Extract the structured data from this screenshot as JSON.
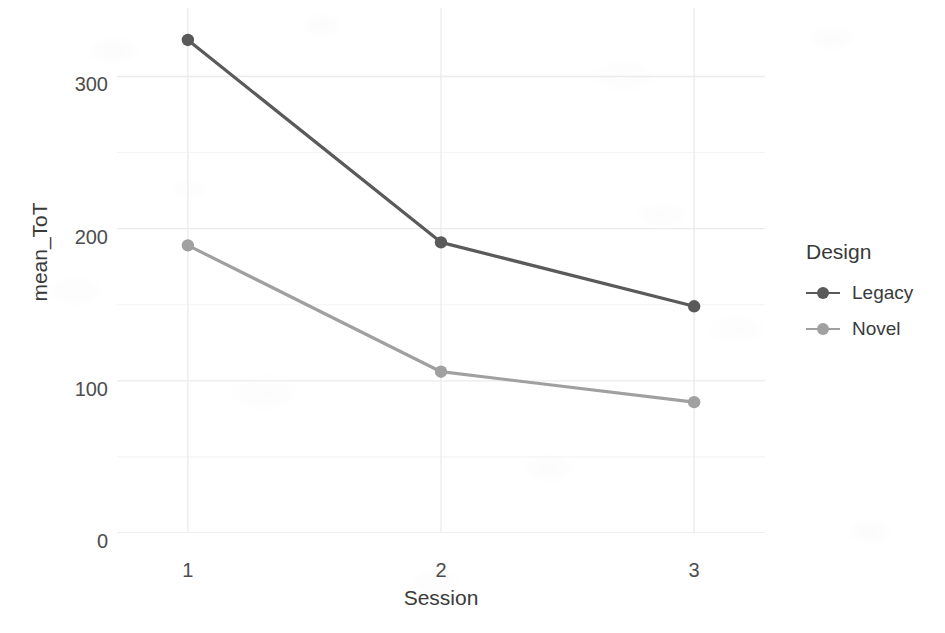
{
  "chart_data": {
    "type": "line",
    "title": "",
    "xlabel": "Session",
    "ylabel": "mean_ToT",
    "x": [
      1,
      2,
      3
    ],
    "categories": [
      "1",
      "2",
      "3"
    ],
    "series": [
      {
        "name": "Legacy",
        "values": [
          324,
          191,
          149
        ],
        "color": "#5a5a5a"
      },
      {
        "name": "Novel",
        "values": [
          189,
          106,
          86
        ],
        "color": "#a0a0a0"
      }
    ],
    "xlim": [
      0.72,
      3.28
    ],
    "ylim": [
      0,
      345
    ],
    "y_ticks": [
      0,
      100,
      200,
      300
    ],
    "y_tick_labels": [
      "0",
      "100",
      "200",
      "300"
    ],
    "y_minor_ticks": [
      50,
      150,
      250
    ],
    "x_ticks": [
      1,
      2,
      3
    ],
    "x_tick_labels": [
      "1",
      "2",
      "3"
    ],
    "grid": true,
    "grid_color": "#ebebeb",
    "minor_grid_color": "#f4f4f4",
    "legend_position": "right",
    "legend": {
      "title": "Design",
      "entries": [
        {
          "label": "Legacy",
          "color": "#5a5a5a"
        },
        {
          "label": "Novel",
          "color": "#a0a0a0"
        }
      ]
    },
    "background": "#ffffff"
  },
  "axes": {
    "y_tick_labels": [
      "300",
      "200",
      "100",
      "0"
    ],
    "x_tick_labels": [
      "1",
      "2",
      "3"
    ],
    "x_title": "Session",
    "y_title": "mean_ToT"
  },
  "legend": {
    "title": "Design",
    "items": [
      {
        "label": "Legacy"
      },
      {
        "label": "Novel"
      }
    ]
  },
  "colors": {
    "legacy": "#5a5a5a",
    "novel": "#a0a0a0",
    "grid": "#ebebeb",
    "minor_grid": "#f4f4f4",
    "text": "#3a3a3a",
    "tick_text": "#4d4d4d",
    "background": "#ffffff"
  }
}
